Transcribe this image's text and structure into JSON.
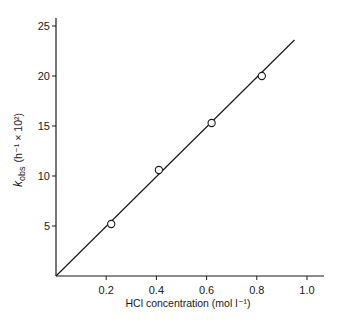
{
  "chart_data": {
    "type": "scatter",
    "title": "",
    "xlabel": "HCl concentration (mol l⁻¹)",
    "ylabel": "k_obs (h⁻¹ × 10²)",
    "ylabel_parts": {
      "symbol": "k",
      "subscript": "obs",
      "units": "(h⁻¹ × 10²)"
    },
    "xlim": [
      0,
      1.07
    ],
    "ylim": [
      0,
      25.8
    ],
    "x_ticks": [
      0.2,
      0.4,
      0.6,
      0.8,
      1.0
    ],
    "x_tick_labels": [
      "0.2",
      "0.4",
      "0.6",
      "0.8",
      "1.0"
    ],
    "y_ticks": [
      5,
      10,
      15,
      20,
      25
    ],
    "y_tick_labels": [
      "5",
      "10",
      "15",
      "20",
      "25"
    ],
    "grid": false,
    "legend": null,
    "series": [
      {
        "name": "observed",
        "marker": "open-circle",
        "x": [
          0.22,
          0.41,
          0.62,
          0.82
        ],
        "y": [
          5.2,
          10.6,
          15.3,
          20.0
        ]
      },
      {
        "name": "linear fit",
        "style": "line",
        "x": [
          0.0,
          0.95
        ],
        "y": [
          0.0,
          23.6
        ]
      }
    ]
  },
  "colors": {
    "ink": "#1a1a1a",
    "background": "#ffffff"
  }
}
